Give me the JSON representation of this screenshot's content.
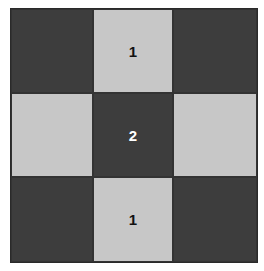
{
  "board": {
    "rows": 3,
    "cols": 3,
    "colors": {
      "dark": "#3d3d3d",
      "light": "#c7c7c7"
    },
    "cells": [
      {
        "row": 0,
        "col": 0,
        "shade": "dark",
        "label": ""
      },
      {
        "row": 0,
        "col": 1,
        "shade": "light",
        "label": "1"
      },
      {
        "row": 0,
        "col": 2,
        "shade": "dark",
        "label": ""
      },
      {
        "row": 1,
        "col": 0,
        "shade": "light",
        "label": ""
      },
      {
        "row": 1,
        "col": 1,
        "shade": "dark",
        "label": "2"
      },
      {
        "row": 1,
        "col": 2,
        "shade": "light",
        "label": ""
      },
      {
        "row": 2,
        "col": 0,
        "shade": "dark",
        "label": ""
      },
      {
        "row": 2,
        "col": 1,
        "shade": "light",
        "label": "1"
      },
      {
        "row": 2,
        "col": 2,
        "shade": "dark",
        "label": ""
      }
    ]
  }
}
